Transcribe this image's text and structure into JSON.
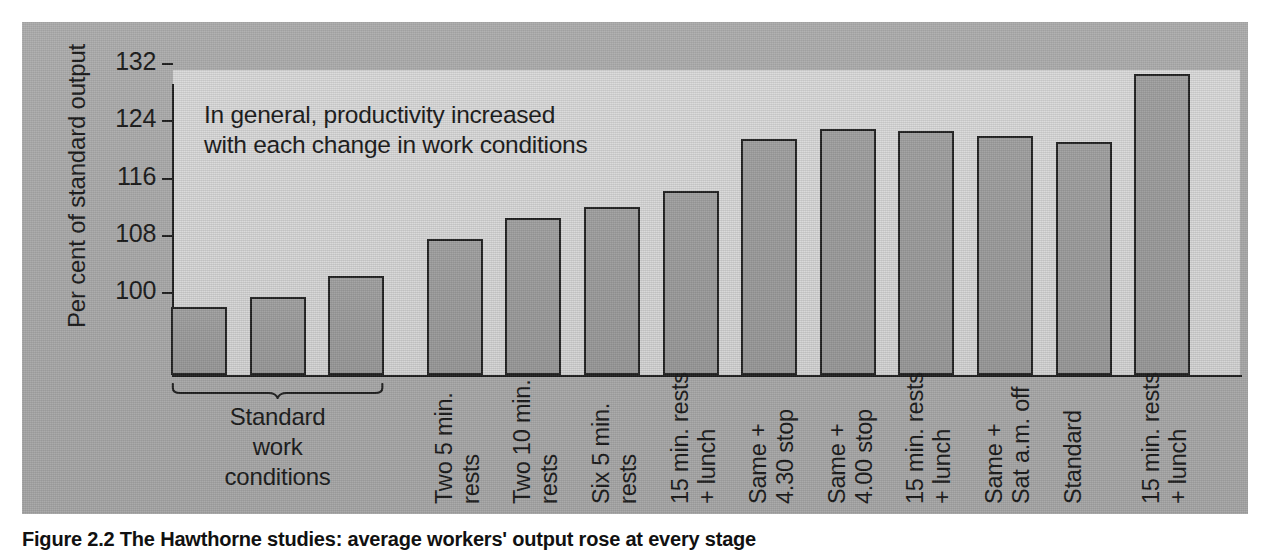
{
  "figure": {
    "caption": "Figure 2.2  The Hawthorne studies: average workers' output rose at every stage",
    "annotation": "In general, productivity increased\nwith each change in work conditions",
    "group_bracket_label": "Standard\nwork\nconditions"
  },
  "colors": {
    "panel_background": "#a8a8a8",
    "plot_background": "#d4d4d4",
    "bar_fill": "#989898",
    "bar_outline": "#1e1e1e",
    "axis": "#1a1a1a",
    "text": "#151515"
  },
  "chart_data": {
    "type": "bar",
    "title": "",
    "xlabel": "",
    "ylabel": "Per cent of standard output",
    "ylim": [
      96,
      133
    ],
    "yticks": [
      100,
      108,
      116,
      124,
      132
    ],
    "ytick_labels": [
      "100",
      "108",
      "116",
      "124",
      "132"
    ],
    "grid": false,
    "legend": "none",
    "annotations": [
      "In general, productivity increased with each change in work conditions"
    ],
    "group_brackets": [
      {
        "label": "Standard work conditions",
        "bars": [
          0,
          1,
          2
        ]
      }
    ],
    "categories": [
      "",
      "",
      "",
      "Two 5 min.\nrests",
      "Two 10 min.\nrests",
      "Six 5 min.\nrests",
      "15 min. rests\n+ lunch",
      "Same +\n4.30 stop",
      "Same +\n4.00 stop",
      "15 min. rests\n+ lunch",
      "Same +\nSat a.m. off",
      "Standard",
      "15 min. rests\n+ lunch"
    ],
    "values": [
      98.0,
      99.4,
      102.4,
      107.5,
      110.5,
      112.0,
      114.2,
      121.5,
      122.9,
      122.6,
      121.9,
      121.1,
      130.6
    ]
  }
}
